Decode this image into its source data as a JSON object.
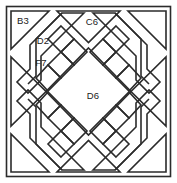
{
  "diagram": {
    "type": "patchwork-block",
    "canvas": {
      "width": 177,
      "height": 183
    },
    "colors": {
      "line": "#2b2b2b",
      "fill": "#ffffff",
      "background": "#ffffff",
      "label_text": "#1a1a1a"
    },
    "line_weight": 1.6,
    "labels": {
      "corner_triangle_top_left": "B3",
      "edge_triangle_top": "C6",
      "band_square_upper_left": "D2",
      "band_strip_upper_left": "F7",
      "center_diamond": "D6"
    },
    "pieces": [
      {
        "id": "B3",
        "shape": "corner-triangle",
        "position": "top-left",
        "labeled": true
      },
      {
        "id": "",
        "shape": "corner-triangle",
        "position": "top-right",
        "labeled": false
      },
      {
        "id": "",
        "shape": "corner-triangle",
        "position": "bottom-left",
        "labeled": false
      },
      {
        "id": "",
        "shape": "corner-triangle",
        "position": "bottom-right",
        "labeled": false
      },
      {
        "id": "C6",
        "shape": "edge-triangle",
        "position": "top",
        "labeled": true
      },
      {
        "id": "",
        "shape": "edge-triangle",
        "position": "right",
        "labeled": false
      },
      {
        "id": "",
        "shape": "edge-triangle",
        "position": "bottom",
        "labeled": false
      },
      {
        "id": "",
        "shape": "edge-triangle",
        "position": "left",
        "labeled": false
      },
      {
        "id": "D6",
        "shape": "center-diamond",
        "position": "center",
        "labeled": true
      },
      {
        "id": "D2",
        "shape": "band-square",
        "position": "upper-left-band",
        "labeled": true
      },
      {
        "id": "F7",
        "shape": "band-strip",
        "position": "upper-left-band",
        "labeled": true
      }
    ],
    "bands": [
      {
        "position": "upper-left",
        "subdivisions": 4
      },
      {
        "position": "upper-right",
        "subdivisions": 4
      },
      {
        "position": "lower-left",
        "subdivisions": 4
      },
      {
        "position": "lower-right",
        "subdivisions": 4
      }
    ]
  }
}
